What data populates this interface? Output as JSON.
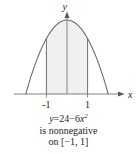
{
  "figure": {
    "axes": {
      "x_axis_label": "x",
      "y_axis_label": "y",
      "tick_labels": [
        "-1",
        "1"
      ]
    },
    "caption": {
      "line1_lhs": "y",
      "line1_eq": "=",
      "line1_a": "24",
      "line1_minus": "−",
      "line1_coef": "6",
      "line1_var": "x",
      "line1_exp": "2",
      "line2": "is nonnegative",
      "line3_prefix": "on ",
      "line3_interval": "[−1, 1]"
    }
  },
  "chart_data": {
    "type": "line",
    "title": "",
    "subtitle": "",
    "xlabel": "x",
    "ylabel": "y",
    "function": "y = 24 - 6x^2",
    "a": 24,
    "b": -6,
    "xlim": [
      -2.2,
      2.2
    ],
    "ylim": [
      0,
      26
    ],
    "xticks": [
      -1,
      1
    ],
    "xtick_labels": [
      "-1",
      "1"
    ],
    "yticks": [],
    "ytick_labels": [],
    "grid": false,
    "legend": null,
    "roots": [
      -2,
      2
    ],
    "vertex": [
      0,
      24
    ],
    "shaded_region": {
      "from": -1,
      "to": 1,
      "label": "nonnegative on [-1, 1]",
      "fill": "#f0f0f0"
    },
    "vertical_lines_at_x": [
      -1,
      0,
      1
    ],
    "curve_color": "#6d6e71",
    "axis_color": "#808285",
    "series": [
      {
        "name": "y = 24 - 6x^2",
        "x": [
          -2.0,
          -1.75,
          -1.5,
          -1.25,
          -1.0,
          -0.75,
          -0.5,
          -0.25,
          0.0,
          0.25,
          0.5,
          0.75,
          1.0,
          1.25,
          1.5,
          1.75,
          2.0
        ],
        "y": [
          0,
          5.625,
          10.5,
          14.625,
          18,
          20.625,
          22.5,
          23.625,
          24,
          23.625,
          22.5,
          20.625,
          18,
          14.625,
          10.5,
          5.625,
          0
        ]
      }
    ]
  }
}
